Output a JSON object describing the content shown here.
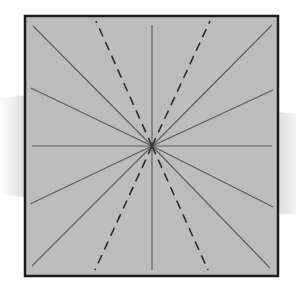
{
  "diagram": {
    "title": "",
    "colors": {
      "page_background": "#ffffff",
      "swoosh_band": "#e2e2e2",
      "square_fill": "#bcbcbc",
      "square_border": "#1c1c1c",
      "solid_line": "#5c5c5c",
      "dashed_line": "#2e2e2e"
    },
    "square": {
      "x": 25,
      "y": 16,
      "width": 253,
      "height": 260,
      "border_width": 2.5
    },
    "center": {
      "x": 152,
      "y": 146
    },
    "solid_rays": [
      {
        "name": "up",
        "x": 152,
        "y": 25
      },
      {
        "name": "down",
        "x": 152,
        "y": 270
      },
      {
        "name": "left",
        "x": 32,
        "y": 146
      },
      {
        "name": "right",
        "x": 272,
        "y": 146
      },
      {
        "name": "up-left-diagonal",
        "x": 33,
        "y": 26
      },
      {
        "name": "up-right-diagonal",
        "x": 272,
        "y": 25
      },
      {
        "name": "down-left-diagonal",
        "x": 32,
        "y": 266
      },
      {
        "name": "down-right-diagonal",
        "x": 270,
        "y": 268
      },
      {
        "name": "left-upper-shallow",
        "x": 31,
        "y": 88
      },
      {
        "name": "left-lower-shallow",
        "x": 30,
        "y": 204
      },
      {
        "name": "right-upper-shallow",
        "x": 273,
        "y": 90
      },
      {
        "name": "right-lower-shallow",
        "x": 273,
        "y": 207
      }
    ],
    "dashed_rays": [
      {
        "name": "up-left-steep",
        "x": 96,
        "y": 21
      },
      {
        "name": "up-right-steep",
        "x": 210,
        "y": 21
      },
      {
        "name": "down-left-steep",
        "x": 95,
        "y": 270
      },
      {
        "name": "down-right-steep",
        "x": 208,
        "y": 270
      }
    ]
  }
}
